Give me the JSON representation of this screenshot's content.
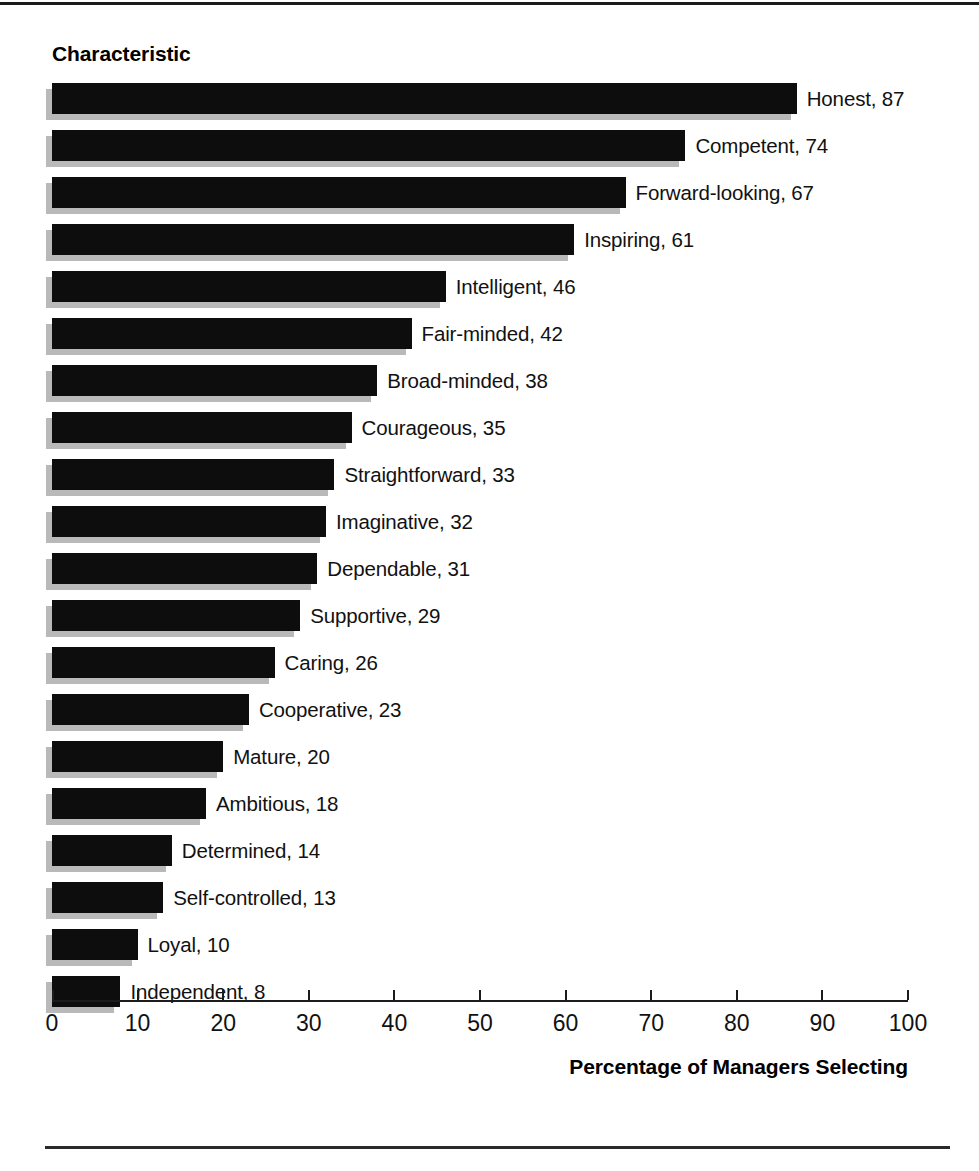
{
  "figure": {
    "category_axis_title": "Characteristic",
    "value_axis_title": "Percentage of Managers Selecting"
  },
  "chart_data": {
    "type": "bar",
    "orientation": "horizontal",
    "title": "",
    "xlabel": "Percentage of Managers Selecting",
    "ylabel": "Characteristic",
    "xlim": [
      0,
      100
    ],
    "xticks": [
      0,
      10,
      20,
      30,
      40,
      50,
      60,
      70,
      80,
      90,
      100
    ],
    "grid": false,
    "legend": false,
    "bar_color": "#0d0d0d",
    "shadow_color": "#b9b9b9",
    "label_format": "{category}, {value}",
    "categories": [
      "Honest",
      "Competent",
      "Forward-looking",
      "Inspiring",
      "Intelligent",
      "Fair-minded",
      "Broad-minded",
      "Courageous",
      "Straightforward",
      "Imaginative",
      "Dependable",
      "Supportive",
      "Caring",
      "Cooperative",
      "Mature",
      "Ambitious",
      "Determined",
      "Self-controlled",
      "Loyal",
      "Independent"
    ],
    "values": [
      87,
      74,
      67,
      61,
      46,
      42,
      38,
      35,
      33,
      32,
      31,
      29,
      26,
      23,
      20,
      18,
      14,
      13,
      10,
      8
    ],
    "data_labels": [
      "Honest, 87",
      "Competent, 74",
      "Forward-looking, 67",
      "Inspiring, 61",
      "Intelligent, 46",
      "Fair-minded, 42",
      "Broad-minded, 38",
      "Courageous, 35",
      "Straightforward, 33",
      "Imaginative, 32",
      "Dependable, 31",
      "Supportive, 29",
      "Caring, 26",
      "Cooperative, 23",
      "Mature, 20",
      "Ambitious, 18",
      "Determined, 14",
      "Self-controlled, 13",
      "Loyal, 10",
      "Independent, 8"
    ]
  },
  "xtick_labels": [
    "0",
    "10",
    "20",
    "30",
    "40",
    "50",
    "60",
    "70",
    "80",
    "90",
    "100"
  ]
}
